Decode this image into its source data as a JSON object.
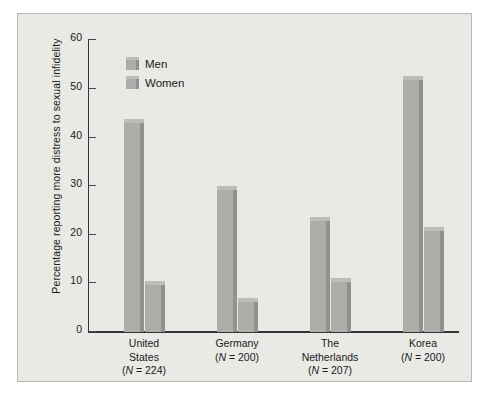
{
  "chart_data": {
    "type": "bar",
    "title": "",
    "subtitle": "",
    "xlabel": "",
    "ylabel": "Percentage reporting more distress to sexual infidelity",
    "ylim": [
      0,
      60
    ],
    "yticks": [
      0,
      10,
      20,
      30,
      40,
      50,
      60
    ],
    "grid": false,
    "legend_position": "top-left",
    "categories": [
      "United States",
      "Germany",
      "The Netherlands",
      "Korea"
    ],
    "category_lines": [
      [
        "United",
        "States",
        "(N = 224)"
      ],
      [
        "Germany",
        "(N = 200)"
      ],
      [
        "The",
        "Netherlands",
        "(N = 207)"
      ],
      [
        "Korea",
        "(N = 200)"
      ]
    ],
    "sample_sizes": [
      224,
      200,
      207,
      200
    ],
    "series": [
      {
        "name": "Men",
        "values": [
          43.7,
          29.8,
          23.5,
          52.5
        ]
      },
      {
        "name": "Women",
        "values": [
          10.5,
          7.0,
          11.0,
          21.5
        ]
      }
    ],
    "bar_color": "#adadaa",
    "bar_shadow_color": "#919190",
    "panel_color": "#e9e9e6",
    "axis_color": "#35353a"
  },
  "legend": {
    "items": [
      {
        "label": "Men",
        "swatch": "legend-swatch-men"
      },
      {
        "label": "Women",
        "swatch": "legend-swatch-women"
      }
    ]
  },
  "yticks": {
    "t0": "0",
    "t10": "10",
    "t20": "20",
    "t30": "30",
    "t40": "40",
    "t50": "50",
    "t60": "60"
  },
  "xlabels": {
    "us_l1": "United",
    "us_l2": "States",
    "us_l3_pre": "(",
    "us_l3_n": "N",
    "us_l3_post": " = 224)",
    "de_l1": "Germany",
    "de_l2_pre": "(",
    "de_l2_n": "N",
    "de_l2_post": " = 200)",
    "nl_l1": "The",
    "nl_l2": "Netherlands",
    "nl_l3_pre": "(",
    "nl_l3_n": "N",
    "nl_l3_post": " = 207)",
    "kr_l1": "Korea",
    "kr_l2_pre": "(",
    "kr_l2_n": "N",
    "kr_l2_post": " = 200)"
  },
  "axis": {
    "ylabel": "Percentage reporting more distress to sexual infidelity"
  }
}
